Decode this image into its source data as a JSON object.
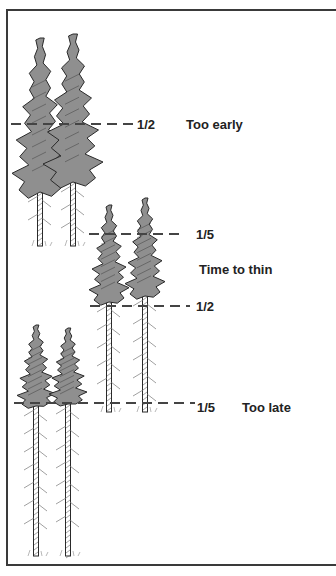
{
  "diagram": {
    "colors": {
      "crown": "#8f8f8f",
      "outline": "#2a2a2a",
      "dash": "#444444",
      "frame": "#3a3a3a",
      "text": "#222222"
    },
    "stages": [
      {
        "id": "too-early",
        "label": "Too early",
        "markers": [
          {
            "fraction": "1/2",
            "line": {
              "x1": 11,
              "x2": 135,
              "y": 124
            },
            "label_x": 137,
            "label_y": 118
          }
        ],
        "label_x": 186,
        "label_y": 118,
        "trees": [
          {
            "x": 40,
            "top": 38,
            "crown_bottom": 188,
            "crown_half_width": 28,
            "base": 246
          },
          {
            "x": 73,
            "top": 34,
            "crown_bottom": 178,
            "crown_half_width": 30,
            "base": 246
          }
        ]
      },
      {
        "id": "time-to-thin",
        "label": "Time to thin",
        "markers": [
          {
            "fraction": "1/5",
            "line": {
              "x1": 89,
              "x2": 183,
              "y": 234
            },
            "label_x": 196,
            "label_y": 228
          },
          {
            "fraction": "1/2",
            "line": {
              "x1": 90,
              "x2": 190,
              "y": 306
            },
            "label_x": 196,
            "label_y": 300
          }
        ],
        "label_x": 199,
        "label_y": 263,
        "trees": [
          {
            "x": 109,
            "top": 205,
            "crown_bottom": 298,
            "crown_half_width": 20,
            "base": 412
          },
          {
            "x": 145,
            "top": 198,
            "crown_bottom": 292,
            "crown_half_width": 20,
            "base": 412
          }
        ]
      },
      {
        "id": "too-late",
        "label": "Too late",
        "markers": [
          {
            "fraction": "1/5",
            "line": {
              "x1": 14,
              "x2": 195,
              "y": 403
            },
            "label_x": 197,
            "label_y": 401
          }
        ],
        "label_x": 242,
        "label_y": 401,
        "trees": [
          {
            "x": 36,
            "top": 325,
            "crown_bottom": 402,
            "crown_half_width": 19,
            "base": 556
          },
          {
            "x": 68,
            "top": 328,
            "crown_bottom": 400,
            "crown_half_width": 19,
            "base": 556
          }
        ]
      }
    ]
  }
}
